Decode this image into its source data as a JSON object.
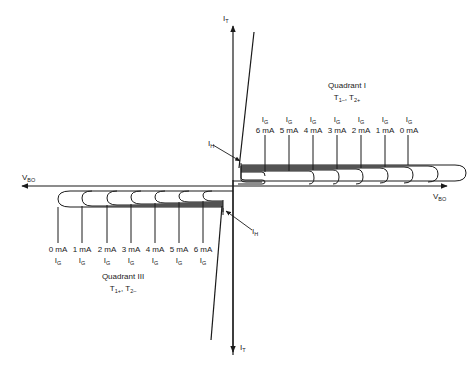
{
  "diagram": {
    "type": "triac-iv-characteristic",
    "axes": {
      "y_positive_label": "I",
      "y_positive_sub": "T",
      "y_negative_label": "I",
      "y_negative_sub": "T",
      "x_positive_label": "V",
      "x_positive_sub": "BO",
      "x_negative_label": "V",
      "x_negative_sub": "BO"
    },
    "quadrant_1": {
      "title": "Quadrant I",
      "t1": "T",
      "t1_sub": "1–",
      "sep": ",",
      "t2": "T",
      "t2_sub": "2+",
      "holding_label": "I",
      "holding_sub": "H",
      "gate_currents": [
        {
          "label": "I",
          "sub": "G",
          "value": "6 mA"
        },
        {
          "label": "I",
          "sub": "G",
          "value": "5 mA"
        },
        {
          "label": "I",
          "sub": "G",
          "value": "4 mA"
        },
        {
          "label": "I",
          "sub": "G",
          "value": "3 mA"
        },
        {
          "label": "I",
          "sub": "G",
          "value": "2 mA"
        },
        {
          "label": "I",
          "sub": "G",
          "value": "1 mA"
        },
        {
          "label": "I",
          "sub": "G",
          "value": "0 mA"
        }
      ]
    },
    "quadrant_3": {
      "title": "Quadrant III",
      "t1": "T",
      "t1_sub": "1+",
      "sep": ",",
      "t2": "T",
      "t2_sub": "2–",
      "holding_label": "I",
      "holding_sub": "H",
      "gate_currents": [
        {
          "label": "I",
          "sub": "G",
          "value": "0 mA"
        },
        {
          "label": "I",
          "sub": "G",
          "value": "1 mA"
        },
        {
          "label": "I",
          "sub": "G",
          "value": "2 mA"
        },
        {
          "label": "I",
          "sub": "G",
          "value": "3 mA"
        },
        {
          "label": "I",
          "sub": "G",
          "value": "4 mA"
        },
        {
          "label": "I",
          "sub": "G",
          "value": "5 mA"
        },
        {
          "label": "I",
          "sub": "G",
          "value": "6 mA"
        }
      ]
    },
    "colors": {
      "line": "#1a1a1a",
      "background": "#ffffff"
    }
  }
}
